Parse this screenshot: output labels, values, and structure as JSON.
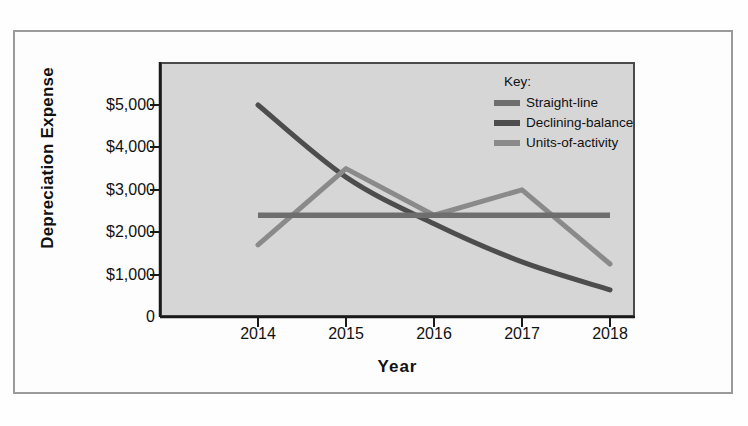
{
  "chart_data": {
    "type": "line",
    "title": "",
    "xlabel": "Year",
    "ylabel": "Depreciation Expense",
    "categories": [
      "2014",
      "2015",
      "2016",
      "2017",
      "2018"
    ],
    "x": [
      2014,
      2015,
      2016,
      2017,
      2018
    ],
    "ylim": [
      0,
      5600
    ],
    "xlim": [
      2013.6,
      2018.4
    ],
    "grid": false,
    "legend_position": "top-right inside plot",
    "legend_title": "Key:",
    "y_ticks": [
      {
        "value": 5000,
        "label": "$5,000"
      },
      {
        "value": 4000,
        "label": "$4,000"
      },
      {
        "value": 3000,
        "label": "$3,000"
      },
      {
        "value": 2000,
        "label": "$2,000"
      },
      {
        "value": 1000,
        "label": "$1,000"
      },
      {
        "value": 0,
        "label": "0"
      }
    ],
    "series": [
      {
        "name": "Straight-line",
        "color": "#6e6e6e",
        "values": [
          2400,
          2400,
          2400,
          2400,
          2400
        ]
      },
      {
        "name": "Declining-balance",
        "color": "#4d4d4d",
        "values": [
          5000,
          3300,
          2200,
          1300,
          640
        ]
      },
      {
        "name": "Units-of-activity",
        "color": "#8a8a8a",
        "values": [
          1700,
          3500,
          2400,
          3000,
          1250
        ]
      }
    ]
  },
  "axes": {
    "y_title": "Depreciation Expense",
    "x_title": "Year"
  },
  "legend": {
    "title": "Key:",
    "items": [
      {
        "label": "Straight-line",
        "color": "#6e6e6e"
      },
      {
        "label": "Declining-balance",
        "color": "#4d4d4d"
      },
      {
        "label": "Units-of-activity",
        "color": "#8a8a8a"
      }
    ]
  },
  "colors": {
    "plot_background": "#d6d6d6",
    "page_background": "#fefefe",
    "frame_border": "#9a9a9a",
    "axis_line": "#1a1a1a",
    "text": "#111111"
  }
}
